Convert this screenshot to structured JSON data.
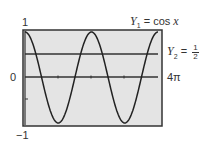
{
  "chart_data": {
    "type": "line",
    "title": "",
    "xlabel": "",
    "ylabel": "",
    "xlim": [
      0,
      12.566
    ],
    "ylim": [
      -1,
      1
    ],
    "x_tick_labels": [
      "0",
      "4π"
    ],
    "y_tick_labels": [
      "1",
      "0",
      "-1"
    ],
    "grid": false,
    "background": "#e4e4e4",
    "series": [
      {
        "name": "Y1 = cos x",
        "function": "cos(x)",
        "color": "#222222"
      },
      {
        "name": "Y2 = 1/2",
        "function": "0.5",
        "color": "#222222"
      }
    ],
    "annotations": [
      "Y1 = cos x",
      "Y2 = 1/2",
      "4π"
    ]
  },
  "labels": {
    "y_max": "1",
    "y_zero": "0",
    "y_min": "−1",
    "x_max": "4π",
    "y1_name": "Y",
    "y1_sub": "1",
    "y1_eq": " = cos ",
    "y1_var": "x",
    "y2_name": "Y",
    "y2_sub": "2",
    "y2_eq": " = ",
    "y2_num": "1",
    "y2_den": "2"
  }
}
